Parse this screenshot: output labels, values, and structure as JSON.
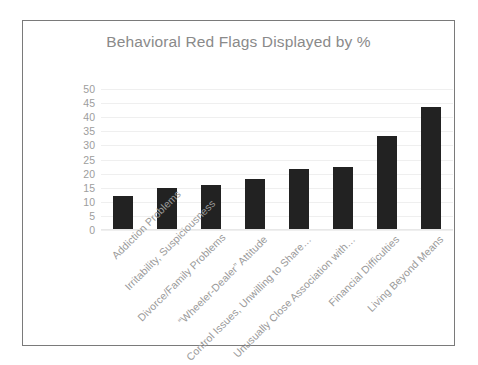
{
  "chart_data": {
    "type": "bar",
    "title": "Behavioral Red Flags Displayed by %",
    "xlabel": "",
    "ylabel": "",
    "ylim": [
      0,
      50
    ],
    "ytick_step": 5,
    "yticks": [
      50,
      45,
      40,
      35,
      30,
      25,
      20,
      15,
      10,
      5,
      0
    ],
    "grid": true,
    "legend": false,
    "bar_color": "#222222",
    "categories": [
      "Addiction Problems",
      "Irritability, Suspiciousness",
      "Divorce/Family Problems",
      "“Wheeler-Dealer” Attitude",
      "Control Issues, Unwilling to Share…",
      "Unusually Close Association with…",
      "Financial Difficulties",
      "Living Beyond Means"
    ],
    "values": [
      12,
      15,
      16,
      18,
      21.5,
      22.5,
      33.5,
      43.5
    ]
  }
}
